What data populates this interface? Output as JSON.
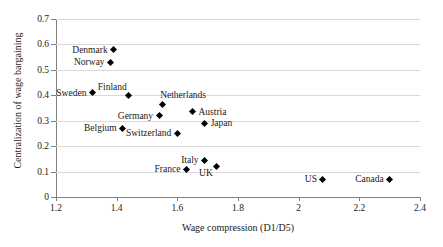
{
  "chart_data": {
    "type": "scatter",
    "title": "",
    "xlabel": "Wage compression (D1/D5)",
    "ylabel": "Centralization of wage bargaining",
    "xlim": [
      1.2,
      2.4
    ],
    "ylim": [
      0,
      0.7
    ],
    "xticks": [
      "1.2",
      "1.4",
      "1.6",
      "1.8",
      "2",
      "2.2",
      "2.4"
    ],
    "xtick_values": [
      1.2,
      1.4,
      1.6,
      1.8,
      2.0,
      2.2,
      2.4
    ],
    "yticks": [
      "0",
      "0.1",
      "0.2",
      "0.3",
      "0.4",
      "0.5",
      "0.6",
      "0.7"
    ],
    "ytick_values": [
      0,
      0.1,
      0.2,
      0.3,
      0.4,
      0.5,
      0.6,
      0.7
    ],
    "grid": "horizontal",
    "legend": "none",
    "marker_style": "filled-diamond",
    "marker_color": "#000000",
    "gridline_color": "#d9d9d9",
    "axis_color": "#808080",
    "points": [
      {
        "label": "Denmark",
        "x": 1.39,
        "y": 0.58,
        "label_pos": "left"
      },
      {
        "label": "Norway",
        "x": 1.38,
        "y": 0.53,
        "label_pos": "left"
      },
      {
        "label": "Sweden",
        "x": 1.32,
        "y": 0.41,
        "label_pos": "left"
      },
      {
        "label": "Finland",
        "x": 1.44,
        "y": 0.4,
        "label_pos": "above-left"
      },
      {
        "label": "Netherlands",
        "x": 1.55,
        "y": 0.365,
        "label_pos": "above-right"
      },
      {
        "label": "Austria",
        "x": 1.65,
        "y": 0.335,
        "label_pos": "right"
      },
      {
        "label": "Germany",
        "x": 1.54,
        "y": 0.32,
        "label_pos": "left"
      },
      {
        "label": "Japan",
        "x": 1.69,
        "y": 0.29,
        "label_pos": "right"
      },
      {
        "label": "Belgium",
        "x": 1.42,
        "y": 0.27,
        "label_pos": "left"
      },
      {
        "label": "Switzerland",
        "x": 1.6,
        "y": 0.25,
        "label_pos": "left"
      },
      {
        "label": "Italy",
        "x": 1.69,
        "y": 0.145,
        "label_pos": "left"
      },
      {
        "label": "UK",
        "x": 1.73,
        "y": 0.12,
        "label_pos": "below-left"
      },
      {
        "label": "France",
        "x": 1.63,
        "y": 0.11,
        "label_pos": "left"
      },
      {
        "label": "US",
        "x": 2.08,
        "y": 0.07,
        "label_pos": "left"
      },
      {
        "label": "Canada",
        "x": 2.3,
        "y": 0.07,
        "label_pos": "left"
      }
    ]
  }
}
